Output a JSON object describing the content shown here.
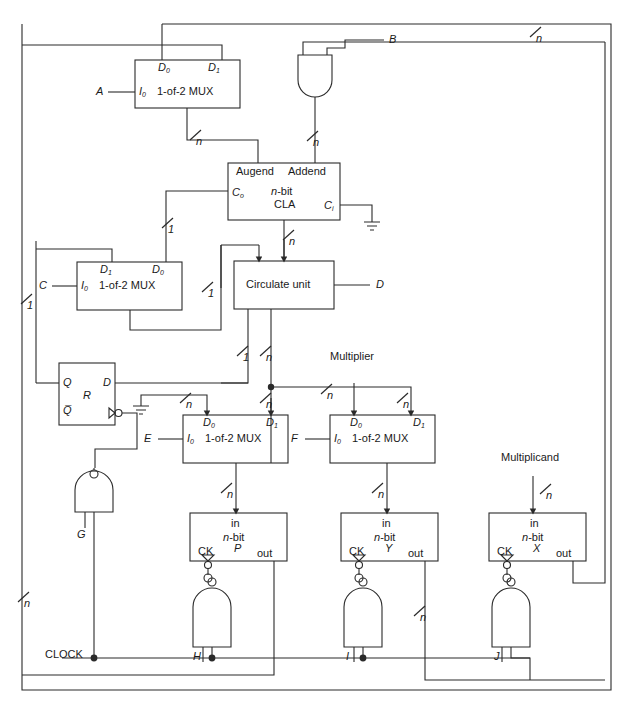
{
  "diagram": {
    "type": "digital-logic-block-diagram",
    "background": "#ffffff",
    "line_color": "#2a2a2a"
  },
  "blocks": [
    {
      "id": "mux_a",
      "label": "1-of-2 MUX",
      "port_left": "I",
      "port_left_sub": "0",
      "port_top_left": "D",
      "port_top_left_sub": "0",
      "port_top_right": "D",
      "port_top_right_sub": "1",
      "x": 135,
      "y": 60,
      "w": 105,
      "h": 48
    },
    {
      "id": "cla",
      "label_top_left": "Augend",
      "label_top_right": "Addend",
      "label_l1": "n-bit",
      "label_l2": "CLA",
      "port_left": "C",
      "port_left_sub": "o",
      "port_right": "C",
      "port_right_sub": "i",
      "x": 228,
      "y": 163,
      "w": 112,
      "h": 57
    },
    {
      "id": "mux_c",
      "label": "1-of-2 MUX",
      "port_left": "I",
      "port_left_sub": "0",
      "port_top_left": "D",
      "port_top_left_sub": "1",
      "port_top_right": "D",
      "port_top_right_sub": "0",
      "x": 77,
      "y": 262,
      "w": 105,
      "h": 48
    },
    {
      "id": "circ",
      "label": "Circulate unit",
      "x": 234,
      "y": 261,
      "w": 100,
      "h": 48
    },
    {
      "id": "ff_r",
      "label": "R",
      "port_q": "Q",
      "port_qbar": "Q̅",
      "port_d": "D",
      "x": 59,
      "y": 363,
      "w": 56,
      "h": 62
    },
    {
      "id": "mux_e",
      "label": "1-of-2 MUX",
      "port_left": "I",
      "port_left_sub": "0",
      "port_top_left": "D",
      "port_top_left_sub": "0",
      "port_top_right": "D",
      "port_top_right_sub": "1",
      "x": 183,
      "y": 415,
      "w": 105,
      "h": 48
    },
    {
      "id": "mux_f",
      "label": "1-of-2 MUX",
      "port_left": "I",
      "port_left_sub": "0",
      "port_top_left": "D",
      "port_top_left_sub": "0",
      "port_top_right": "D",
      "port_top_right_sub": "1",
      "x": 330,
      "y": 415,
      "w": 105,
      "h": 48
    },
    {
      "id": "reg_p",
      "label_in": "in",
      "label_l1": "n-bit",
      "label_l2": "P",
      "label_ck": "CK",
      "label_out": "out",
      "x": 190,
      "y": 513,
      "w": 97,
      "h": 48
    },
    {
      "id": "reg_y",
      "label_in": "in",
      "label_l1": "n-bit",
      "label_l2": "Y",
      "label_ck": "CK",
      "label_out": "out",
      "x": 341,
      "y": 513,
      "w": 97,
      "h": 48
    },
    {
      "id": "reg_x",
      "label_in": "in",
      "label_l1": "n-bit",
      "label_l2": "X",
      "label_ck": "CK",
      "label_out": "out",
      "x": 489,
      "y": 513,
      "w": 97,
      "h": 48
    }
  ],
  "signal_labels": {
    "a": "A",
    "b": "B",
    "c": "C",
    "d": "D",
    "e": "E",
    "f": "F",
    "g": "G",
    "h": "H",
    "i": "I",
    "j": "J",
    "clock": "CLOCK",
    "multiplier": "Multiplier",
    "multiplicand": "Multiplicand"
  },
  "bus_widths": {
    "n": "n",
    "one": "1"
  },
  "bus_tags": [
    {
      "label": "n",
      "x": 536,
      "y": 33
    },
    {
      "label": "n",
      "x": 196,
      "y": 136
    },
    {
      "label": "n",
      "x": 313,
      "y": 137
    },
    {
      "label": "1",
      "x": 168,
      "y": 224
    },
    {
      "label": "n",
      "x": 289,
      "y": 236
    },
    {
      "label": "1",
      "x": 27,
      "y": 300
    },
    {
      "label": "1",
      "x": 208,
      "y": 288
    },
    {
      "label": "1",
      "x": 243,
      "y": 352
    },
    {
      "label": "n",
      "x": 266,
      "y": 352
    },
    {
      "label": "n",
      "x": 186,
      "y": 399
    },
    {
      "label": "n",
      "x": 266,
      "y": 399
    },
    {
      "label": "n",
      "x": 327,
      "y": 390
    },
    {
      "label": "n",
      "x": 403,
      "y": 399
    },
    {
      "label": "n",
      "x": 546,
      "y": 490
    },
    {
      "label": "n",
      "x": 227,
      "y": 489
    },
    {
      "label": "n",
      "x": 378,
      "y": 489
    },
    {
      "label": "n",
      "x": 24,
      "y": 598
    },
    {
      "label": "n",
      "x": 420,
      "y": 612
    }
  ],
  "gates": [
    {
      "id": "and_b",
      "type": "and",
      "inputs": [
        "B",
        "n-bus"
      ],
      "x": 298,
      "y": 55
    },
    {
      "id": "nand_g",
      "type": "nand-inverted-output",
      "label": "G",
      "x": 75,
      "y": 480
    },
    {
      "id": "nand_h",
      "type": "nand-inverted-output",
      "label": "H",
      "x": 193,
      "y": 590
    },
    {
      "id": "nand_i",
      "type": "nand-inverted-output",
      "label": "I",
      "x": 344,
      "y": 590
    },
    {
      "id": "nand_j",
      "type": "nand-inverted-output",
      "label": "J",
      "x": 492,
      "y": 590
    }
  ]
}
